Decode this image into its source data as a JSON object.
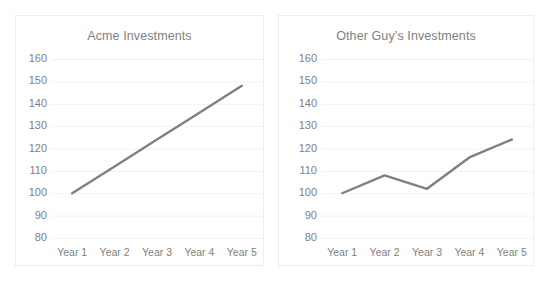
{
  "page": {
    "background_color": "#ffffff",
    "width": 549,
    "height": 284,
    "clipped_top_text_left": "",
    "clipped_top_text_right": ""
  },
  "style": {
    "series_line_color": "#808080",
    "gridline_color": "#f2f2f3",
    "tick_label_color": "#7f7f7f",
    "title_color": "#7f7f7f",
    "card_border_color": "#eeeef0"
  },
  "chart_data": [
    {
      "type": "line",
      "title": "Acme Investments",
      "xlabel": "",
      "ylabel": "",
      "categories": [
        "Year 1",
        "Year 2",
        "Year 3",
        "Year 4",
        "Year 5"
      ],
      "values": [
        100,
        112,
        124,
        136,
        148
      ],
      "series": [
        {
          "name": "Acme Investments",
          "values": [
            100,
            112,
            124,
            136,
            148
          ]
        }
      ],
      "ylim": [
        80,
        160
      ],
      "yticks": [
        160,
        150,
        140,
        130,
        120,
        110,
        100,
        90,
        80
      ],
      "grid": true,
      "legend": false,
      "legend_position": "none",
      "markers": false,
      "line_color": "#808080"
    },
    {
      "type": "line",
      "title": "Other Guy’s Investments",
      "xlabel": "",
      "ylabel": "",
      "categories": [
        "Year 1",
        "Year 2",
        "Year 3",
        "Year 4",
        "Year 5"
      ],
      "values": [
        100,
        108,
        102,
        116,
        124
      ],
      "series": [
        {
          "name": "Other Guy’s Investments",
          "values": [
            100,
            108,
            102,
            116,
            124
          ]
        }
      ],
      "ylim": [
        80,
        160
      ],
      "yticks": [
        160,
        150,
        140,
        130,
        120,
        110,
        100,
        90,
        80
      ],
      "grid": true,
      "legend": false,
      "legend_position": "none",
      "markers": false,
      "line_color": "#808080"
    }
  ]
}
